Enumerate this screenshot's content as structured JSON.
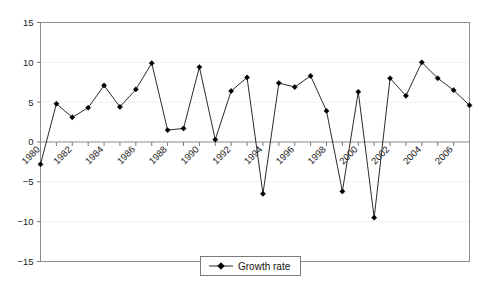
{
  "chart_data": {
    "type": "line",
    "title": "",
    "xlabel": "",
    "ylabel": "",
    "x": [
      1980,
      1981,
      1982,
      1983,
      1984,
      1985,
      1986,
      1987,
      1988,
      1989,
      1990,
      1991,
      1992,
      1993,
      1994,
      1995,
      1996,
      1997,
      1998,
      1999,
      2000,
      2001,
      2002,
      2003,
      2004,
      2005,
      2006,
      2007
    ],
    "series": [
      {
        "name": "Growth rate",
        "values": [
          -2.8,
          4.8,
          3.1,
          4.3,
          7.1,
          4.4,
          6.6,
          9.9,
          1.5,
          1.7,
          9.4,
          0.3,
          6.4,
          8.1,
          -6.5,
          7.4,
          6.9,
          8.3,
          3.9,
          -6.2,
          6.3,
          -9.5,
          8.0,
          5.8,
          10.0,
          8.0,
          6.5,
          4.6
        ],
        "marker": "diamond",
        "color": "#000000"
      }
    ],
    "ylim": [
      -15,
      15
    ],
    "ytick_values": [
      -15,
      -10,
      -5,
      0,
      5,
      10,
      15
    ],
    "ytick_labels": [
      "−15",
      "−10",
      "−5",
      "0",
      "5",
      "10",
      "15"
    ],
    "xtick_values": [
      1980,
      1982,
      1984,
      1986,
      1988,
      1990,
      1992,
      1994,
      1996,
      1998,
      2000,
      2002,
      2004,
      2006
    ],
    "xtick_labels": [
      "1980",
      "1982",
      "1984",
      "1986",
      "1988",
      "1990",
      "1992",
      "1994",
      "1996",
      "1998",
      "2000",
      "2002",
      "2004",
      "2006"
    ],
    "xtick_rotation": -45,
    "xlim": [
      1980,
      2007
    ],
    "grid": true,
    "grid_axis": "y",
    "legend": {
      "position": "bottom-center",
      "entries": [
        "Growth rate"
      ]
    }
  },
  "colors": {
    "series": "#000000",
    "grid": "#d9d9d9",
    "axis": "#8c8c8c",
    "zero_axis": "#8a8a8a",
    "text": "#1a1a1a",
    "background": "#ffffff"
  }
}
